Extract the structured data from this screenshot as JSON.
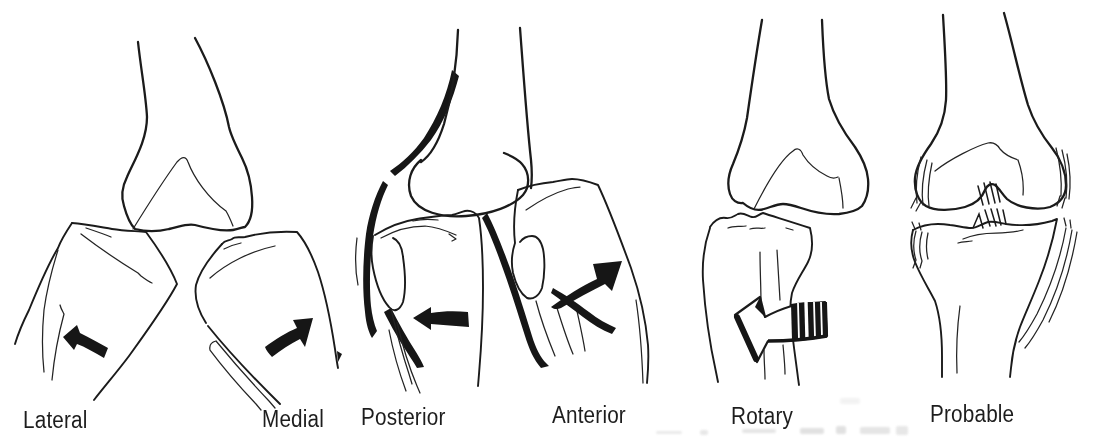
{
  "colors": {
    "ink": "#1b1b1b",
    "paper": "#ffffff"
  },
  "panels": [
    {
      "id": "lateral",
      "label": "Lateral"
    },
    {
      "id": "medial",
      "label": "Medial"
    },
    {
      "id": "posterior",
      "label": "Posterior"
    },
    {
      "id": "anterior",
      "label": "Anterior"
    },
    {
      "id": "rotary",
      "label": "Rotary"
    },
    {
      "id": "probable",
      "label": "Probable"
    }
  ]
}
